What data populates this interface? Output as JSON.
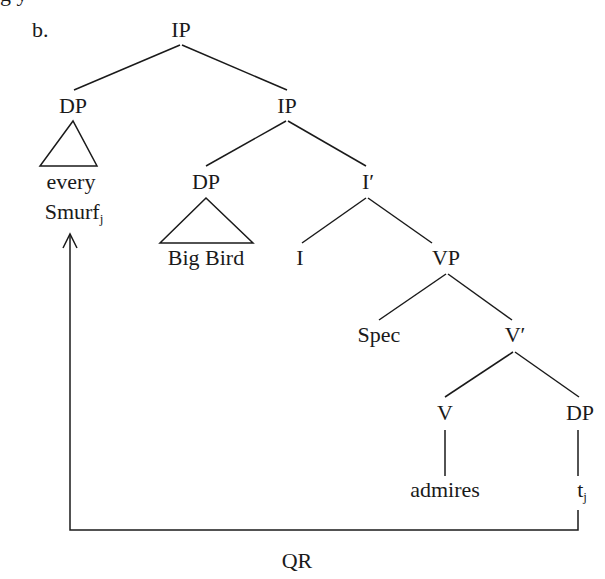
{
  "example_label": "b.",
  "top_cut_text": "g                                 y",
  "tree": {
    "root": "IP",
    "quantifier_dp": {
      "label": "DP",
      "word1": "every",
      "word2": "Smurf",
      "index": "j"
    },
    "inner_ip": "IP",
    "subject_dp": {
      "label": "DP",
      "words": "Big Bird"
    },
    "i_bar": "I′",
    "i_head": "I",
    "vp": "VP",
    "spec": "Spec",
    "v_bar": "V′",
    "v_head": "V",
    "verb": "admires",
    "object_dp": "DP",
    "trace": "t",
    "trace_index": "j"
  },
  "movement_label": "QR",
  "colors": {
    "ink": "#1a1a1a",
    "background": "#ffffff"
  }
}
